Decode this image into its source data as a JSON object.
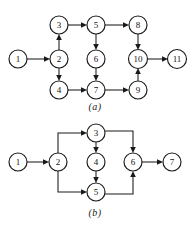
{
  "figure": {
    "background_color": "#ffffff",
    "line_color": "#1a1a1a",
    "node_fill": "#ffffff",
    "node_radius": 9
  },
  "diagrams": [
    {
      "id": "a",
      "caption": "(a)",
      "node_count": 11,
      "nodes": [
        {
          "id": "1",
          "label": "1",
          "x": 18,
          "y": 59
        },
        {
          "id": "2",
          "label": "2",
          "x": 59,
          "y": 59
        },
        {
          "id": "3",
          "label": "3",
          "x": 59,
          "y": 25
        },
        {
          "id": "4",
          "label": "4",
          "x": 59,
          "y": 90
        },
        {
          "id": "5",
          "label": "5",
          "x": 96,
          "y": 25
        },
        {
          "id": "6",
          "label": "6",
          "x": 96,
          "y": 59
        },
        {
          "id": "7",
          "label": "7",
          "x": 96,
          "y": 90
        },
        {
          "id": "8",
          "label": "8",
          "x": 138,
          "y": 25
        },
        {
          "id": "9",
          "label": "9",
          "x": 138,
          "y": 90
        },
        {
          "id": "10",
          "label": "10",
          "x": 138,
          "y": 59
        },
        {
          "id": "11",
          "label": "11",
          "x": 177,
          "y": 59
        }
      ],
      "edges": [
        {
          "from": "1",
          "to": "2",
          "direction": "right"
        },
        {
          "from": "2",
          "to": "3",
          "direction": "up"
        },
        {
          "from": "2",
          "to": "4",
          "direction": "down"
        },
        {
          "from": "3",
          "to": "5",
          "direction": "right"
        },
        {
          "from": "5",
          "to": "6",
          "direction": "down"
        },
        {
          "from": "6",
          "to": "7",
          "direction": "down"
        },
        {
          "from": "4",
          "to": "7",
          "direction": "right"
        },
        {
          "from": "5",
          "to": "8",
          "direction": "right"
        },
        {
          "from": "7",
          "to": "9",
          "direction": "right"
        },
        {
          "from": "8",
          "to": "10",
          "direction": "down"
        },
        {
          "from": "9",
          "to": "10",
          "direction": "up"
        },
        {
          "from": "10",
          "to": "11",
          "direction": "right"
        }
      ]
    },
    {
      "id": "b",
      "caption": "(b)",
      "node_count": 7,
      "nodes": [
        {
          "id": "1",
          "label": "1",
          "x": 18,
          "y": 162
        },
        {
          "id": "2",
          "label": "2",
          "x": 58,
          "y": 162
        },
        {
          "id": "3",
          "label": "3",
          "x": 96,
          "y": 133
        },
        {
          "id": "4",
          "label": "4",
          "x": 96,
          "y": 162
        },
        {
          "id": "5",
          "label": "5",
          "x": 96,
          "y": 192
        },
        {
          "id": "6",
          "label": "6",
          "x": 133,
          "y": 162
        },
        {
          "id": "7",
          "label": "7",
          "x": 172,
          "y": 162
        }
      ],
      "edges": [
        {
          "from": "1",
          "to": "2",
          "direction": "right",
          "routing": "straight"
        },
        {
          "from": "2",
          "to": "3",
          "direction": "right",
          "routing": "elbow-up"
        },
        {
          "from": "2",
          "to": "5",
          "direction": "right",
          "routing": "elbow-down"
        },
        {
          "from": "3",
          "to": "4",
          "direction": "down",
          "routing": "straight"
        },
        {
          "from": "4",
          "to": "5",
          "direction": "down",
          "routing": "straight"
        },
        {
          "from": "3",
          "to": "6",
          "direction": "down",
          "routing": "elbow-down"
        },
        {
          "from": "5",
          "to": "6",
          "direction": "up",
          "routing": "elbow-up"
        },
        {
          "from": "6",
          "to": "7",
          "direction": "right",
          "routing": "straight"
        }
      ]
    }
  ]
}
